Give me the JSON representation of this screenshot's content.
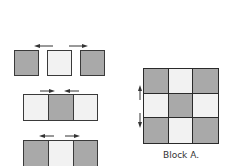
{
  "figure": {
    "pieces": [
      {
        "shade": "dark"
      },
      {
        "shade": "light"
      },
      {
        "shade": "dark"
      }
    ],
    "row_middle": [
      "light",
      "dark",
      "light"
    ],
    "row_bottom": [
      "dark",
      "light",
      "dark"
    ],
    "block": {
      "cells": [
        "dark",
        "light",
        "dark",
        "light",
        "dark",
        "light",
        "dark",
        "light",
        "dark"
      ],
      "label": "Block A."
    },
    "arrows": {
      "top_row": [
        "left",
        "right"
      ],
      "middle_row": [
        "right",
        "left"
      ],
      "bottom_row": [
        "left",
        "right"
      ],
      "block_side": [
        "up",
        "down"
      ]
    },
    "colors": {
      "dark": "#a9a9a9",
      "light": "#f2f2f2",
      "outline": "#3a3a3a"
    }
  }
}
